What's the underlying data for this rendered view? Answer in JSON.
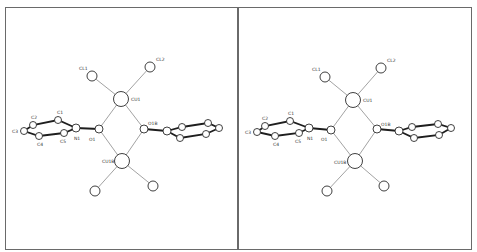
{
  "figure": {
    "type": "stereo-pair molecular structure (ORTEP-style)",
    "panels": [
      "left-view",
      "right-view"
    ]
  },
  "labels": {
    "cl1": "CL1",
    "cl2": "CL2",
    "cu1": "CU1",
    "cu1b": "CU1B",
    "o1": "O1",
    "o1b": "O1B",
    "n1": "N1",
    "c1": "C1",
    "c2": "C2",
    "c3": "C3",
    "c4": "C4",
    "c5": "C5"
  },
  "colors": {
    "frame": "#6a6a6a",
    "thick_bond": "#1e1e1e",
    "thin_bond": "#8a8a8a",
    "atom_outline": "#2a2a2a"
  }
}
